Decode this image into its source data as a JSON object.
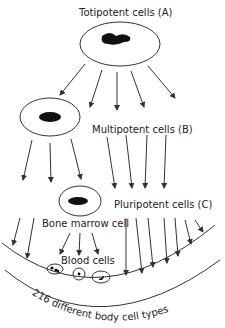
{
  "diagram": {
    "labels": {
      "totipotent": "Totipotent cells (A)",
      "multipotent": "Multipotent cells (B)",
      "pluripotent": "Pluripotent cells (C)",
      "bone_marrow": "Bone marrow cell",
      "blood_cells": "Blood cells",
      "body_types": "216 different body cell types"
    },
    "colors": {
      "stroke": "#333333",
      "nucleus": "#111111",
      "text": "#222222"
    }
  }
}
